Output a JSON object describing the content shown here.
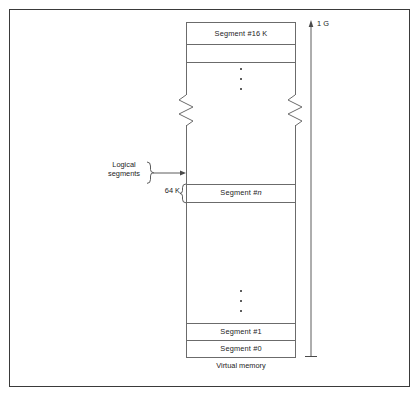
{
  "figure": {
    "caption": "Virtual memory"
  },
  "memory_map": {
    "segments": [
      {
        "id": "top",
        "label": "Segment #16 K",
        "label_html": "Segment #16 K"
      },
      {
        "id": "n",
        "label": "Segment #n"
      },
      {
        "id": "one",
        "label": "Segment #1"
      },
      {
        "id": "zero",
        "label": "Segment #0"
      }
    ],
    "segment_top_label": "Segment #16 K",
    "segment_n_prefix": "Segment #",
    "segment_n_index": "n",
    "segment_one_label": "Segment #1",
    "segment_zero_label": "Segment #0",
    "ellipsis_upper": "vertical-ellipsis",
    "ellipsis_lower": "vertical-ellipsis",
    "break_symbol": "zigzag-break"
  },
  "annotations": {
    "logical_segments_line1": "Logical",
    "logical_segments_line2": "segments",
    "segment_size": "64 K",
    "address_space_top": "1 G"
  },
  "icons": {
    "pointer_arrow": "arrow-right-icon",
    "range_arrow": "arrow-up-icon",
    "brace_right": "curly-brace-right-icon",
    "brace_left": "curly-brace-left-icon"
  },
  "colors": {
    "frame": "#3a3a3a",
    "line": "#6b6b6b",
    "text": "#1c1c1c",
    "background": "#ffffff"
  }
}
